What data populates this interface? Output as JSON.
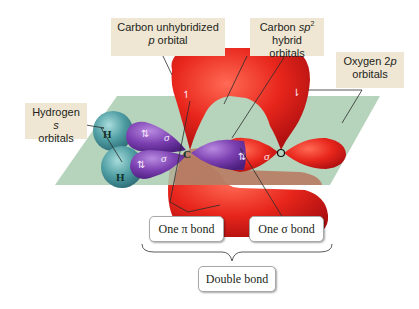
{
  "callouts": {
    "carbon_p": {
      "line1": "Carbon unhybridized",
      "line2_italic": "p",
      "line2_rest": " orbital"
    },
    "carbon_sp2": {
      "line1_prefix": "Carbon ",
      "line1_italic": "sp",
      "line1_sup": "2",
      "line2": "hybrid orbitals"
    },
    "oxygen_2p": {
      "line1_prefix": "Oxygen 2",
      "line1_italic": "p",
      "line2": "orbitals"
    },
    "hydrogen_s": {
      "line1_prefix": "Hydrogen ",
      "line1_italic": "s",
      "line2": "orbitals"
    }
  },
  "atoms": {
    "hydrogen_top": "H",
    "hydrogen_bottom": "H",
    "carbon": "C",
    "oxygen": "O"
  },
  "orbital_labels": {
    "sigma": "σ",
    "electron_pair": "⇅",
    "electron_down": "⇂",
    "electron_up": "↿"
  },
  "bond_boxes": {
    "pi_bond": "One π bond",
    "sigma_bond": "One σ bond",
    "double_bond": "Double bond"
  },
  "colors": {
    "pi_orbital": "#e8261c",
    "sp2_orbital": "#7b3fb0",
    "hydrogen_orbital": "#4f9ea3",
    "plane": "#a9cbb0",
    "callout_bg": "#efe6d3"
  }
}
